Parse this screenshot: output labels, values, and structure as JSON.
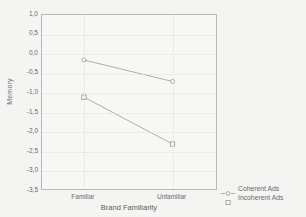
{
  "chart_data": {
    "type": "line",
    "title": "",
    "xlabel": "Brand Familiarity",
    "ylabel": "Memory",
    "categories": [
      "Familiar",
      "Unfamiliar"
    ],
    "ylim": [
      -3.5,
      1.0
    ],
    "ytick_labels": [
      "1,0",
      "0,5",
      "0,0",
      "-0,5",
      "-1,0",
      "-1,5",
      "-2,0",
      "-2,5",
      "-3,0",
      "-3,5"
    ],
    "ytick_values": [
      1.0,
      0.5,
      0.0,
      -0.5,
      -1.0,
      -1.5,
      -2.0,
      -2.5,
      -3.0,
      -3.5
    ],
    "grid": true,
    "legend_position": "right-bottom-outside",
    "series": [
      {
        "name": "Coherent Ads",
        "marker": "circle",
        "values": [
          -0.15,
          -0.7
        ]
      },
      {
        "name": "Incoherent Ads",
        "marker": "square",
        "values": [
          -1.1,
          -2.3
        ]
      }
    ]
  },
  "legend": {
    "items": [
      {
        "label": "Coherent Ads",
        "marker": "circle-with-line"
      },
      {
        "label": "Incoherent Ads",
        "marker": "square"
      }
    ]
  },
  "colors": {
    "line": "#9a9a9a",
    "axis": "#b9b9b9",
    "text": "#6a6a6a",
    "background": "#f4f4f2"
  }
}
